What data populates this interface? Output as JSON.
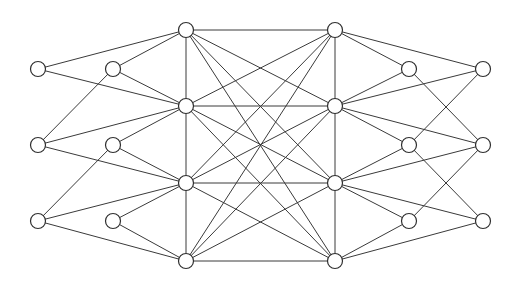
{
  "diagram": {
    "width": 517,
    "height": 287,
    "background_color": "#ffffff",
    "node_fill_color": "#ffffff",
    "node_stroke_color": "#2f2f2f",
    "edge_color": "#3a3a3a",
    "node_radius": 7.5,
    "node_stroke_width": 1.2,
    "edge_stroke_width": 1,
    "node_count": 16,
    "edge_count": 52,
    "nodes": [
      {
        "id": "L1a",
        "label": "",
        "x": 38,
        "y": 69,
        "group": "left-outer"
      },
      {
        "id": "L1b",
        "label": "",
        "x": 38,
        "y": 145,
        "group": "left-outer"
      },
      {
        "id": "L1c",
        "label": "",
        "x": 38,
        "y": 221,
        "group": "left-outer"
      },
      {
        "id": "L2a",
        "label": "",
        "x": 113,
        "y": 69,
        "group": "left-mid"
      },
      {
        "id": "L2b",
        "label": "",
        "x": 113,
        "y": 145,
        "group": "left-mid"
      },
      {
        "id": "L2c",
        "label": "",
        "x": 113,
        "y": 221,
        "group": "left-mid"
      },
      {
        "id": "H1",
        "label": "",
        "x": 186,
        "y": 30,
        "group": "left-hub"
      },
      {
        "id": "H2",
        "label": "",
        "x": 186,
        "y": 106,
        "group": "left-hub"
      },
      {
        "id": "H3",
        "label": "",
        "x": 186,
        "y": 183,
        "group": "left-hub"
      },
      {
        "id": "H4",
        "label": "",
        "x": 186,
        "y": 261,
        "group": "left-hub"
      },
      {
        "id": "K1",
        "label": "",
        "x": 335,
        "y": 30,
        "group": "right-hub"
      },
      {
        "id": "K2",
        "label": "",
        "x": 335,
        "y": 106,
        "group": "right-hub"
      },
      {
        "id": "K3",
        "label": "",
        "x": 335,
        "y": 183,
        "group": "right-hub"
      },
      {
        "id": "K4",
        "label": "",
        "x": 335,
        "y": 261,
        "group": "right-hub"
      },
      {
        "id": "R2a",
        "label": "",
        "x": 409,
        "y": 69,
        "group": "right-mid"
      },
      {
        "id": "R2b",
        "label": "",
        "x": 409,
        "y": 145,
        "group": "right-mid"
      },
      {
        "id": "R2c",
        "label": "",
        "x": 409,
        "y": 221,
        "group": "right-mid"
      },
      {
        "id": "R1a",
        "label": "",
        "x": 483,
        "y": 69,
        "group": "right-outer"
      },
      {
        "id": "R1b",
        "label": "",
        "x": 483,
        "y": 145,
        "group": "right-outer"
      },
      {
        "id": "R1c",
        "label": "",
        "x": 483,
        "y": 221,
        "group": "right-outer"
      }
    ],
    "edges": [
      {
        "from": "L1a",
        "to": "H1"
      },
      {
        "from": "L1a",
        "to": "H2"
      },
      {
        "from": "L1b",
        "to": "H2"
      },
      {
        "from": "L1b",
        "to": "H3"
      },
      {
        "from": "L1c",
        "to": "H3"
      },
      {
        "from": "L1c",
        "to": "H4"
      },
      {
        "from": "L2a",
        "to": "H1"
      },
      {
        "from": "L2a",
        "to": "H2"
      },
      {
        "from": "L2b",
        "to": "H2"
      },
      {
        "from": "L2b",
        "to": "H3"
      },
      {
        "from": "L2c",
        "to": "H3"
      },
      {
        "from": "L2c",
        "to": "H4"
      },
      {
        "from": "H1",
        "to": "H2"
      },
      {
        "from": "H2",
        "to": "H3"
      },
      {
        "from": "H3",
        "to": "H4"
      },
      {
        "from": "H1",
        "to": "K1"
      },
      {
        "from": "H1",
        "to": "K2"
      },
      {
        "from": "H1",
        "to": "K3"
      },
      {
        "from": "H1",
        "to": "K4"
      },
      {
        "from": "H2",
        "to": "K1"
      },
      {
        "from": "H2",
        "to": "K2"
      },
      {
        "from": "H2",
        "to": "K3"
      },
      {
        "from": "H2",
        "to": "K4"
      },
      {
        "from": "H3",
        "to": "K1"
      },
      {
        "from": "H3",
        "to": "K2"
      },
      {
        "from": "H3",
        "to": "K3"
      },
      {
        "from": "H3",
        "to": "K4"
      },
      {
        "from": "H4",
        "to": "K1"
      },
      {
        "from": "H4",
        "to": "K2"
      },
      {
        "from": "H4",
        "to": "K3"
      },
      {
        "from": "H4",
        "to": "K4"
      },
      {
        "from": "K1",
        "to": "K2"
      },
      {
        "from": "K2",
        "to": "K3"
      },
      {
        "from": "K3",
        "to": "K4"
      },
      {
        "from": "K1",
        "to": "R2a"
      },
      {
        "from": "K2",
        "to": "R2a"
      },
      {
        "from": "K2",
        "to": "R2b"
      },
      {
        "from": "K3",
        "to": "R2b"
      },
      {
        "from": "K3",
        "to": "R2c"
      },
      {
        "from": "K4",
        "to": "R2c"
      },
      {
        "from": "K1",
        "to": "R1a"
      },
      {
        "from": "K2",
        "to": "R1a"
      },
      {
        "from": "K2",
        "to": "R1b"
      },
      {
        "from": "K3",
        "to": "R1b"
      },
      {
        "from": "K3",
        "to": "R1c"
      },
      {
        "from": "K4",
        "to": "R1c"
      },
      {
        "from": "R2a",
        "to": "R1b"
      },
      {
        "from": "R2b",
        "to": "R1a"
      },
      {
        "from": "R2b",
        "to": "R1c"
      },
      {
        "from": "R2c",
        "to": "R1b"
      },
      {
        "from": "L2a",
        "to": "L1b"
      },
      {
        "from": "L2b",
        "to": "L1c"
      }
    ]
  }
}
